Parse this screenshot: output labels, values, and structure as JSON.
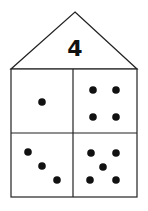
{
  "diagram": {
    "type": "number-house",
    "roof_number": "4",
    "colors": {
      "line": "#222222",
      "dot": "#111111",
      "background": "#ffffff"
    },
    "rooms": [
      {
        "position": "top-left",
        "dot_count": 1
      },
      {
        "position": "top-right",
        "dot_count": 4
      },
      {
        "position": "bottom-left",
        "dot_count": 3
      },
      {
        "position": "bottom-right",
        "dot_count": 5
      }
    ]
  }
}
